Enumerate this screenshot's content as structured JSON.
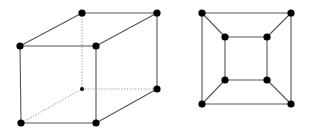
{
  "figure": {
    "width": 311,
    "height": 133,
    "background": "#ffffff",
    "line_color": "#555555",
    "vertex_color": "#000000",
    "vertex_radius": 3.6,
    "hidden_vertex_radius": 2
  },
  "diagrams": [
    {
      "name": "cube-perspective",
      "description": "Cube drawn in oblique projection with hidden edges dotted",
      "vertices": [
        {
          "id": "front-top-left",
          "x": 20,
          "y": 46,
          "hidden": false
        },
        {
          "id": "front-top-right",
          "x": 96,
          "y": 46,
          "hidden": false
        },
        {
          "id": "front-bottom-left",
          "x": 21,
          "y": 123,
          "hidden": false
        },
        {
          "id": "front-bottom-right",
          "x": 96,
          "y": 123,
          "hidden": false
        },
        {
          "id": "back-top-left",
          "x": 82,
          "y": 13,
          "hidden": false
        },
        {
          "id": "back-top-right",
          "x": 157,
          "y": 13,
          "hidden": false
        },
        {
          "id": "back-bottom-left",
          "x": 82,
          "y": 89,
          "hidden": true
        },
        {
          "id": "back-bottom-right",
          "x": 157,
          "y": 89,
          "hidden": false
        }
      ],
      "edges": [
        {
          "from": "front-top-left",
          "to": "front-top-right",
          "style": "solid"
        },
        {
          "from": "front-top-left",
          "to": "front-bottom-left",
          "style": "solid"
        },
        {
          "from": "front-top-right",
          "to": "front-bottom-right",
          "style": "solid"
        },
        {
          "from": "front-bottom-left",
          "to": "front-bottom-right",
          "style": "solid"
        },
        {
          "from": "front-top-left",
          "to": "back-top-left",
          "style": "solid"
        },
        {
          "from": "front-top-right",
          "to": "back-top-right",
          "style": "solid"
        },
        {
          "from": "back-top-left",
          "to": "back-top-right",
          "style": "solid"
        },
        {
          "from": "back-top-right",
          "to": "back-bottom-right",
          "style": "solid"
        },
        {
          "from": "front-bottom-right",
          "to": "back-bottom-right",
          "style": "solid"
        },
        {
          "from": "back-top-left",
          "to": "back-bottom-left",
          "style": "dotted"
        },
        {
          "from": "back-bottom-left",
          "to": "back-bottom-right",
          "style": "dotted"
        },
        {
          "from": "front-bottom-left",
          "to": "back-bottom-left",
          "style": "dotted"
        }
      ]
    },
    {
      "name": "cube-planar-graph",
      "description": "Planar embedding of cube graph: square inside square",
      "vertices": [
        {
          "id": "outer-top-left",
          "x": 202,
          "y": 13,
          "hidden": false
        },
        {
          "id": "outer-top-right",
          "x": 291,
          "y": 13,
          "hidden": false
        },
        {
          "id": "outer-bottom-left",
          "x": 202,
          "y": 104,
          "hidden": false
        },
        {
          "id": "outer-bottom-right",
          "x": 291,
          "y": 104,
          "hidden": false
        },
        {
          "id": "inner-top-left",
          "x": 225,
          "y": 37,
          "hidden": false
        },
        {
          "id": "inner-top-right",
          "x": 267,
          "y": 37,
          "hidden": false
        },
        {
          "id": "inner-bottom-left",
          "x": 225,
          "y": 80,
          "hidden": false
        },
        {
          "id": "inner-bottom-right",
          "x": 267,
          "y": 80,
          "hidden": false
        }
      ],
      "edges": [
        {
          "from": "outer-top-left",
          "to": "outer-top-right",
          "style": "solid"
        },
        {
          "from": "outer-top-right",
          "to": "outer-bottom-right",
          "style": "solid"
        },
        {
          "from": "outer-bottom-right",
          "to": "outer-bottom-left",
          "style": "solid"
        },
        {
          "from": "outer-bottom-left",
          "to": "outer-top-left",
          "style": "solid"
        },
        {
          "from": "inner-top-left",
          "to": "inner-top-right",
          "style": "solid"
        },
        {
          "from": "inner-top-right",
          "to": "inner-bottom-right",
          "style": "solid"
        },
        {
          "from": "inner-bottom-right",
          "to": "inner-bottom-left",
          "style": "solid"
        },
        {
          "from": "inner-bottom-left",
          "to": "inner-top-left",
          "style": "solid"
        },
        {
          "from": "outer-top-left",
          "to": "inner-top-left",
          "style": "solid"
        },
        {
          "from": "outer-top-right",
          "to": "inner-top-right",
          "style": "solid"
        },
        {
          "from": "outer-bottom-left",
          "to": "inner-bottom-left",
          "style": "solid"
        },
        {
          "from": "outer-bottom-right",
          "to": "inner-bottom-right",
          "style": "solid"
        }
      ]
    }
  ]
}
